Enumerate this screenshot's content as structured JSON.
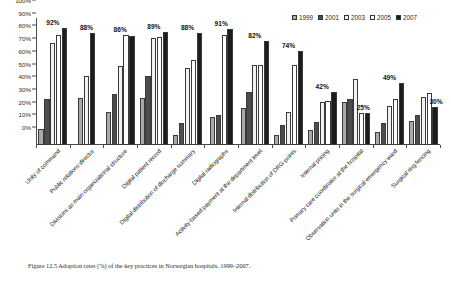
{
  "chart_data": {
    "type": "bar",
    "title": "",
    "xlabel": "",
    "ylabel": "",
    "ylim": [
      0,
      100
    ],
    "ytick_labels": [
      "0%",
      "10%",
      "20%",
      "30%",
      "40%",
      "50%",
      "60%",
      "70%",
      "80%",
      "90%",
      "100%"
    ],
    "ytick_values": [
      0,
      10,
      20,
      30,
      40,
      50,
      60,
      70,
      80,
      90,
      100
    ],
    "grid": false,
    "legend_position": "top-right",
    "categories": [
      "Unity of command",
      "Public relations director",
      "Divisions as main organizational structure",
      "Digital patient record",
      "Digital distribution of discharge summary",
      "Digital radiographs",
      "Activity-based payment at the department level",
      "Internal distribution of DRG-points",
      "Internal pricing",
      "Primary care coordinator at the hospital",
      "Observation units in the surgical emergency ward",
      "Surgical ring fencing"
    ],
    "series": [
      {
        "name": "1999",
        "color": "#a9a9a9",
        "values": [
          13,
          37,
          26,
          37,
          8,
          22,
          29,
          8,
          12,
          34,
          10,
          19
        ]
      },
      {
        "name": "2001",
        "color": "#4d4d4d",
        "values": [
          36,
          null,
          40,
          54,
          17,
          24,
          42,
          16,
          18,
          36,
          17,
          24
        ]
      },
      {
        "name": "2003",
        "color": "#f2f2f2",
        "values": [
          80,
          54,
          62,
          84,
          61,
          null,
          63,
          26,
          34,
          52,
          31,
          38
        ]
      },
      {
        "name": "2005",
        "color": "#ffffff",
        "values": [
          87,
          null,
          87,
          85,
          67,
          87,
          63,
          63,
          35,
          25,
          36,
          41
        ]
      },
      {
        "name": "2007",
        "color": "#1c1c1c",
        "values": [
          92,
          88,
          86,
          89,
          88,
          91,
          82,
          74,
          42,
          25,
          49,
          30
        ]
      }
    ],
    "group_value_labels": [
      "92%",
      "88%",
      "86%",
      "89%",
      "88%",
      "91%",
      "82%",
      "74%",
      "42%",
      "25%",
      "49%",
      "30%"
    ],
    "legend_entries": [
      {
        "label": "1999",
        "color": "#a9a9a9"
      },
      {
        "label": "2001",
        "color": "#4d4d4d"
      },
      {
        "label": "2003",
        "color": "#f2f2f2"
      },
      {
        "label": "2005",
        "color": "#ffffff"
      },
      {
        "label": "2007",
        "color": "#1c1c1c"
      }
    ]
  },
  "caption": {
    "text": "Figure 12.5  Adoption rates (%) of the key practices in Norwegian hospitals, 1999–2007."
  }
}
